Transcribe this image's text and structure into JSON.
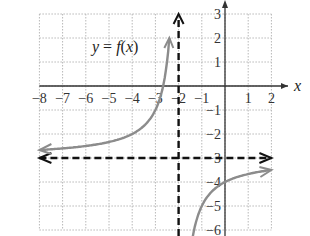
{
  "chart_data": {
    "type": "line",
    "title": "",
    "function_label": "y = f(x)",
    "function_label_parts": {
      "y": "y",
      "eq": " = ",
      "f": "f",
      "open": "(",
      "x": "x",
      "close": ")"
    },
    "xlabel": "x",
    "ylabel": "",
    "xlim": [
      -8,
      2
    ],
    "ylim": [
      -6,
      3
    ],
    "grid": true,
    "x_ticks": [
      "-8",
      "-7",
      "-6",
      "-5",
      "-4",
      "-3",
      "-2",
      "-1",
      "1",
      "2"
    ],
    "y_ticks": [
      "3",
      "2",
      "1",
      "-1",
      "-2",
      "-3",
      "-4",
      "-5",
      "-6"
    ],
    "asymptotes": {
      "vertical": -2,
      "horizontal": -3
    },
    "series": [
      {
        "name": "f(x) left branch",
        "x": [
          -8,
          -7,
          -6,
          -5,
          -4,
          -3,
          -2.4
        ],
        "y": [
          -2.67,
          -2.6,
          -2.5,
          -2.33,
          -2.0,
          -1.0,
          2.0
        ]
      },
      {
        "name": "f(x) right branch",
        "x": [
          -1.4,
          -1,
          0,
          1,
          2
        ],
        "y": [
          -6.33,
          -5.0,
          -4.0,
          -3.67,
          -3.5
        ]
      }
    ],
    "colors": {
      "curve": "#8c8c8c",
      "asymptote": "#111111",
      "grid": "#b8b8b8",
      "axis": "#333333"
    }
  }
}
